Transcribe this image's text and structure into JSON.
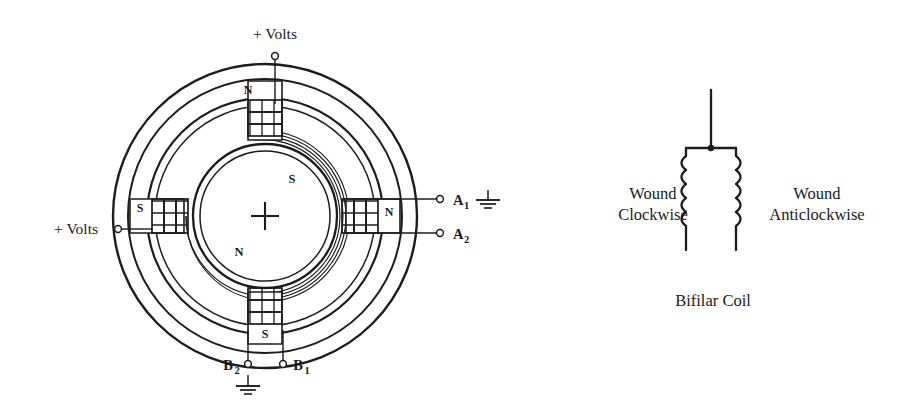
{
  "figure": {
    "kind": "electrical-schematic",
    "title_caption": "Bifilar Coil",
    "ink_color": "#1c1c1c",
    "background_color": "#ffffff"
  },
  "motor": {
    "name": "bifilar-wound-stator-and-rotor",
    "rotor": {
      "top_label": "S",
      "bottom_label": "N",
      "center_marker": "plus-crosshair"
    },
    "poles": [
      {
        "position": "top",
        "label": "N"
      },
      {
        "position": "left",
        "label": "S"
      },
      {
        "position": "right",
        "label": "N"
      },
      {
        "position": "bottom",
        "label": "S"
      }
    ],
    "supply_labels": [
      {
        "id": "supply-top",
        "text": "+ Volts"
      },
      {
        "id": "supply-left",
        "text": "+ Volts"
      }
    ],
    "terminals": [
      {
        "id": "A1",
        "base": "A",
        "sub": "1",
        "grounded": true
      },
      {
        "id": "A2",
        "base": "A",
        "sub": "2",
        "grounded": false
      },
      {
        "id": "B2",
        "base": "B",
        "sub": "2",
        "grounded": true
      },
      {
        "id": "B1",
        "base": "B",
        "sub": "1",
        "grounded": false
      }
    ]
  },
  "bifilar": {
    "left_label_line1": "Wound",
    "left_label_line2": "Clockwise",
    "right_label_line1": "Wound",
    "right_label_line2": "Anticlockwise",
    "caption": "Bifilar Coil"
  }
}
